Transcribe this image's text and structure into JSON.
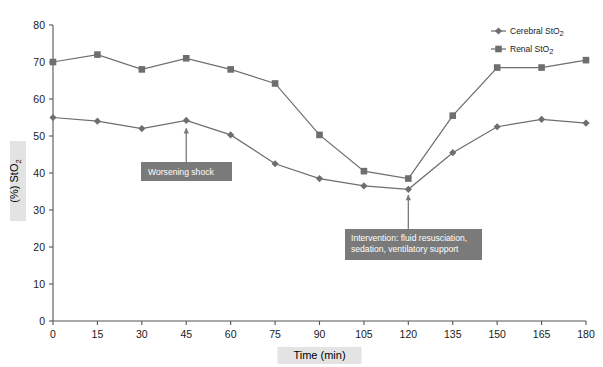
{
  "chart_data": {
    "type": "line",
    "title": "",
    "xlabel": "Time (min)",
    "ylabel": "(%) StO2",
    "ylabel_main": "(%) StO",
    "ylabel_sub": "2",
    "xlim": [
      0,
      180
    ],
    "ylim": [
      0,
      80
    ],
    "grid": false,
    "legend_position": "top-right",
    "x": [
      0,
      15,
      30,
      45,
      60,
      75,
      90,
      105,
      120,
      135,
      150,
      165,
      180
    ],
    "xticks": [
      "0",
      "15",
      "30",
      "45",
      "60",
      "75",
      "90",
      "105",
      "120",
      "135",
      "150",
      "165",
      "180"
    ],
    "yticks": [
      "0",
      "10",
      "20",
      "30",
      "40",
      "50",
      "60",
      "70",
      "80"
    ],
    "ytick_values": [
      0,
      10,
      20,
      30,
      40,
      50,
      60,
      70,
      80
    ],
    "series": [
      {
        "name": "Cerebral StO2",
        "name_main": "Cerebral StO",
        "name_sub": "2",
        "marker": "diamond",
        "color": "#6e6e6e",
        "values": [
          55.0,
          54.0,
          52.0,
          54.2,
          50.3,
          42.5,
          38.5,
          36.5,
          35.6,
          45.5,
          52.5,
          54.5,
          53.5
        ]
      },
      {
        "name": "Renal StO2",
        "name_main": "Renal StO",
        "name_sub": "2",
        "marker": "square",
        "color": "#6e6e6e",
        "values": [
          70.0,
          72.0,
          68.0,
          71.0,
          68.0,
          64.2,
          50.3,
          40.5,
          38.5,
          55.5,
          68.5,
          68.5,
          70.5
        ]
      }
    ],
    "annotations": [
      {
        "id": "worsening-shock",
        "lines": [
          "Worsening shock"
        ],
        "target_x": 45,
        "target_y": 52.0
      },
      {
        "id": "intervention",
        "lines": [
          "Intervention: fluid resusciation,",
          "sedation, ventilatory support"
        ],
        "target_x": 120,
        "target_y": 34.0
      }
    ]
  },
  "axes": {
    "x_axis_title": "Time (min)",
    "y_axis_title_main": "(%) StO",
    "y_axis_title_sub": "2"
  },
  "legend": {
    "entries": [
      {
        "label_main": "Cerebral StO",
        "label_sub": "2",
        "marker": "diamond-marker-icon"
      },
      {
        "label_main": "Renal StO",
        "label_sub": "2",
        "marker": "square-marker-icon"
      }
    ]
  }
}
